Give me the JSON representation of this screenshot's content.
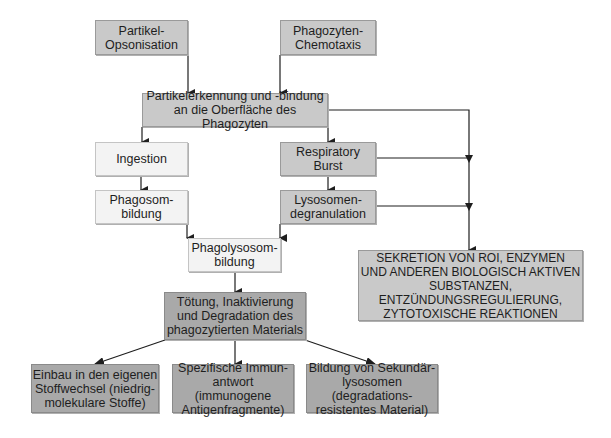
{
  "diagram": {
    "type": "flowchart",
    "nodes": {
      "opsonisation": {
        "label": "Partikel-\nOpsonisation",
        "shade": "mid"
      },
      "chemotaxis": {
        "label": "Phagozyten-\nChemotaxis",
        "shade": "mid"
      },
      "recognition": {
        "label": "Partikelerkennung und -bindung\nan die Oberfläche des Phagozyten",
        "shade": "mid"
      },
      "ingestion": {
        "label": "Ingestion",
        "shade": "light"
      },
      "phagosome": {
        "label": "Phagosom-\nbildung",
        "shade": "light"
      },
      "respiratory_burst": {
        "label": "Respiratory\nBurst",
        "shade": "mid"
      },
      "degranulation": {
        "label": "Lysosomen-\ndegranulation",
        "shade": "mid"
      },
      "phagolysosome": {
        "label": "Phagolysosom-\nbildung",
        "shade": "light"
      },
      "killing": {
        "label": "Tötung, Inaktivierung\nund Degradation des\nphagozytierten Materials",
        "shade": "dark"
      },
      "metabolism": {
        "label": "Einbau in den eigenen\nStoffwechsel (niedrig-\nmolekulare Stoffe)",
        "shade": "dark"
      },
      "immune_response": {
        "label": "Spezifische Immun-\nantwort (immunogene\nAntigenfragmente)",
        "shade": "dark"
      },
      "secondary_lysosomes": {
        "label": "Bildung von Sekundär-\nlysosomen (degradations-\nresistentes Material)",
        "shade": "dark"
      },
      "secretion": {
        "label": "SEKRETION VON ROI, ENZYMEN\nUND ANDEREN BIOLOGISCH AKTIVEN\nSUBSTANZEN,\nENTZÜNDUNGSREGULIERUNG,\nZYTOTOXISCHE REAKTIONEN",
        "shade": "mid"
      }
    },
    "edges": [
      [
        "opsonisation",
        "recognition"
      ],
      [
        "chemotaxis",
        "recognition"
      ],
      [
        "recognition",
        "ingestion"
      ],
      [
        "recognition",
        "respiratory_burst"
      ],
      [
        "recognition",
        "secretion"
      ],
      [
        "ingestion",
        "phagosome"
      ],
      [
        "respiratory_burst",
        "degranulation"
      ],
      [
        "respiratory_burst",
        "secretion"
      ],
      [
        "degranulation",
        "secretion"
      ],
      [
        "phagosome",
        "phagolysosome"
      ],
      [
        "degranulation",
        "phagolysosome"
      ],
      [
        "phagolysosome",
        "killing"
      ],
      [
        "killing",
        "metabolism"
      ],
      [
        "killing",
        "immune_response"
      ],
      [
        "killing",
        "secondary_lysosomes"
      ]
    ],
    "colors": {
      "light_box": "#f3f3f3",
      "mid_box": "#c9c9c9",
      "dark_box": "#a9a9a9",
      "line": "#1e1e1e"
    }
  }
}
